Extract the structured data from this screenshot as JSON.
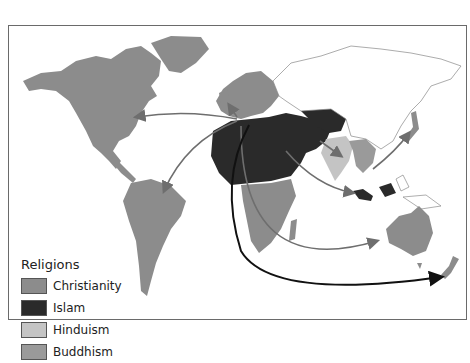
{
  "legend": {
    "title": "Religions",
    "items": [
      {
        "label": "Christianity",
        "color": "#8c8c8c"
      },
      {
        "label": "Islam",
        "color": "#2a2a2a"
      },
      {
        "label": "Hinduism",
        "color": "#c4c4c4"
      },
      {
        "label": "Buddhism",
        "color": "#9a9a9a"
      }
    ]
  },
  "colors": {
    "christianity": "#8c8c8c",
    "islam": "#2a2a2a",
    "hinduism": "#c4c4c4",
    "buddhism": "#9a9a9a",
    "arrow_gray": "#6e6e6e",
    "arrow_black": "#111111"
  }
}
